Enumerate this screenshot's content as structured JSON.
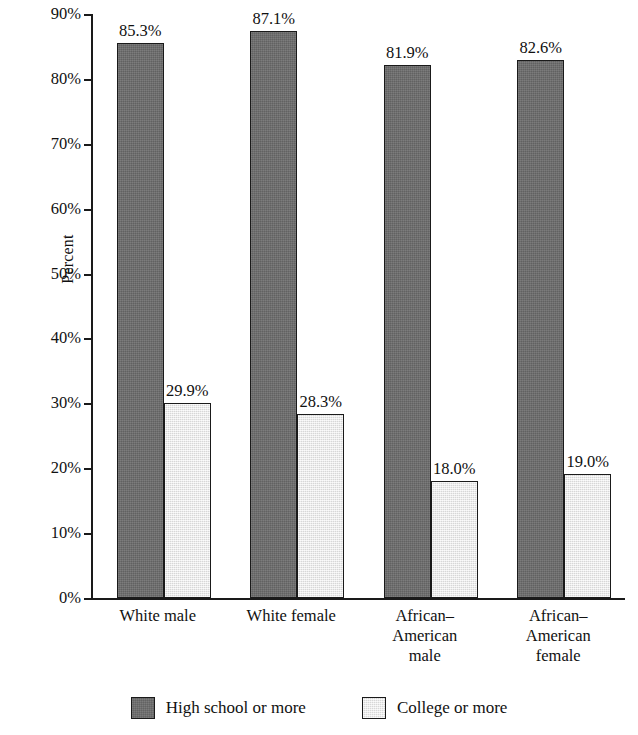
{
  "chart_data": {
    "type": "bar",
    "title": "",
    "xlabel": "",
    "ylabel": "Percent",
    "ylim": [
      0,
      90
    ],
    "grid": false,
    "legend_position": "bottom",
    "y_ticks": [
      "0%",
      "10%",
      "20%",
      "30%",
      "40%",
      "50%",
      "60%",
      "70%",
      "80%",
      "90%"
    ],
    "y_tick_values": [
      0,
      10,
      20,
      30,
      40,
      50,
      60,
      70,
      80,
      90
    ],
    "categories": [
      "White male",
      "White female",
      "African–American male",
      "African–American female"
    ],
    "category_lines": [
      [
        "White male"
      ],
      [
        "White female"
      ],
      [
        "African–",
        "American",
        "male"
      ],
      [
        "African–",
        "American",
        "female"
      ]
    ],
    "series": [
      {
        "name": "High school or more",
        "color": "#6d6d6d",
        "values": [
          85.3,
          87.1,
          81.9,
          82.6
        ],
        "labels": [
          "85.3%",
          "87.1%",
          "81.9%",
          "82.6%"
        ]
      },
      {
        "name": "College or more",
        "color": "#e6e6e6",
        "values": [
          29.9,
          28.3,
          18.0,
          19.0
        ],
        "labels": [
          "29.9%",
          "28.3%",
          "18.0%",
          "19.0%"
        ]
      }
    ]
  },
  "axis": {
    "y_title": "Percent"
  },
  "legend": {
    "items": [
      {
        "label": "High school or more",
        "swatch": "dark"
      },
      {
        "label": "College or more",
        "swatch": "light"
      }
    ]
  },
  "colors": {
    "bar_dark": "#6d6d6d",
    "bar_light": "#e6e6e6",
    "axis": "#1a1a1a",
    "text": "#111111",
    "background": "#ffffff"
  }
}
